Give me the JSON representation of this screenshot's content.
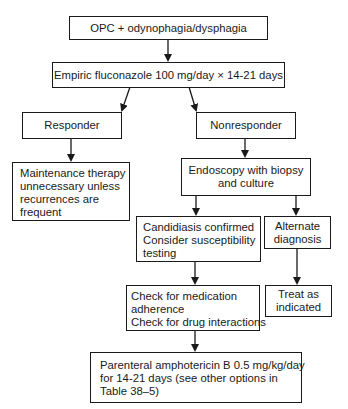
{
  "diagram": {
    "type": "flowchart",
    "nodes": {
      "start": {
        "lines": [
          "OPC + odynophagia/dysphagia"
        ]
      },
      "empiric": {
        "lines": [
          "Empiric fluconazole 100 mg/day × 14-21 days"
        ]
      },
      "responder": {
        "lines": [
          "Responder"
        ]
      },
      "nonresponder": {
        "lines": [
          "Nonresponder"
        ]
      },
      "maintenance": {
        "lines": [
          "Maintenance therapy",
          "unnecessary unless",
          "recurrences are",
          "frequent"
        ]
      },
      "endoscopy": {
        "lines": [
          "Endoscopy with biopsy",
          "and culture"
        ]
      },
      "candidiasis": {
        "lines": [
          "Candidiasis confirmed",
          "Consider susceptibility",
          "testing"
        ]
      },
      "alternate": {
        "lines": [
          "Alternate",
          "diagnosis"
        ]
      },
      "check": {
        "lines": [
          "Check for medication",
          "adherence",
          "Check for drug interactions"
        ]
      },
      "treat": {
        "lines": [
          "Treat as",
          "indicated"
        ]
      },
      "parenteral": {
        "lines": [
          "Parenteral amphotericin B 0.5 mg/kg/day",
          "for 14-21 days (see other options in",
          "Table 38–5)"
        ]
      }
    },
    "edges": [
      [
        "start",
        "empiric"
      ],
      [
        "empiric",
        "responder"
      ],
      [
        "empiric",
        "nonresponder"
      ],
      [
        "responder",
        "maintenance"
      ],
      [
        "nonresponder",
        "endoscopy"
      ],
      [
        "endoscopy",
        "candidiasis"
      ],
      [
        "endoscopy",
        "alternate"
      ],
      [
        "candidiasis",
        "check"
      ],
      [
        "alternate",
        "treat"
      ],
      [
        "check",
        "parenteral"
      ]
    ]
  }
}
